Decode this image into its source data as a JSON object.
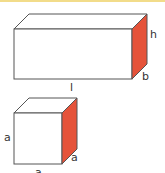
{
  "colors": {
    "top_bar": "#f2dc8a",
    "edge": "#555555",
    "face_front": "#ffffff",
    "face_top": "#ffffff",
    "face_side": "#e5533a"
  },
  "cuboid": {
    "labels": {
      "length": "l",
      "height": "h",
      "breadth": "b"
    }
  },
  "cube": {
    "labels": {
      "left": "a",
      "side": "a",
      "bottom": "a"
    }
  }
}
